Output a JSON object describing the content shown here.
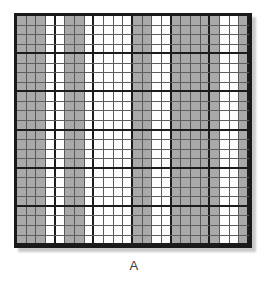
{
  "figure": {
    "caption": "A",
    "panel_label": "A",
    "type": "shaded-column-grid",
    "columns_total": 24,
    "rows_total": 24,
    "major_gridline_interval": 4,
    "colors": {
      "shaded_cell": "#a9a9a9",
      "white_cell": "#fdfdfd",
      "minor_gridline": "#5d5d5d",
      "major_gridline": "#1c1c1c",
      "frame": "#1a1a1a",
      "shadow": "#c9c9c9",
      "background": "#ffffff",
      "caption_text": "#3a3a3a"
    },
    "column_fill_pattern": [
      "shaded",
      "shaded",
      "shaded",
      "white",
      "white",
      "shaded",
      "shaded",
      "white",
      "white",
      "white",
      "white",
      "white",
      "shaded",
      "shaded",
      "white",
      "white",
      "shaded",
      "shaded",
      "shaded",
      "shaded",
      "shaded",
      "white",
      "white",
      "shaded"
    ],
    "row_labels": [
      "1",
      "2",
      "3",
      "4",
      "5",
      "6",
      "7",
      "8",
      "9",
      "10",
      "11",
      "12",
      "13",
      "14",
      "15",
      "16",
      "17",
      "18",
      "19",
      "20",
      "21",
      "22",
      "23",
      "24"
    ]
  }
}
